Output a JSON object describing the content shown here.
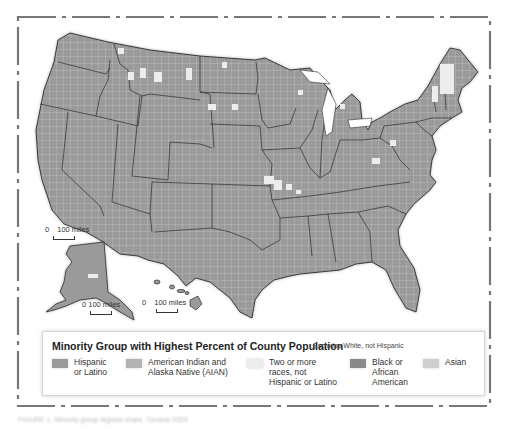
{
  "map": {
    "title": "Minority Group with Highest Percent of County Population",
    "subtitle": "Excludes White, not Hispanic",
    "colors": {
      "hispanic": "#9a9a9a",
      "aian": "#b3b3b3",
      "two_or_more": "#ededed",
      "black": "#8a8a8a",
      "asian": "#cfcfcf",
      "state_border": "#2b2b2b",
      "county_border": "#e2e2e2",
      "frame": "#777777"
    },
    "legend": [
      {
        "key": "hispanic",
        "label": "Hispanic\nor Latino",
        "color": "#9a9a9a"
      },
      {
        "key": "aian",
        "label": "American Indian and\nAlaska Native (AIAN)",
        "color": "#b3b3b3"
      },
      {
        "key": "two_or_more",
        "label": "Two or more\nraces, not\nHispanic or Latino",
        "color": "#ededed"
      },
      {
        "key": "black",
        "label": "Black or\nAfrican\nAmerican",
        "color": "#8a8a8a"
      },
      {
        "key": "asian",
        "label": "Asian",
        "color": "#cfcfcf"
      }
    ],
    "scales": [
      {
        "region": "contiguous-us",
        "label_zero": "0",
        "label_dist": "100 miles"
      },
      {
        "region": "alaska",
        "label_zero": "0",
        "label_dist": "100 miles"
      },
      {
        "region": "hawaii",
        "label_zero": "0",
        "label_dist": "100 miles"
      }
    ]
  },
  "footer": {
    "caption": "FIGURE 1. Minority group highest share, Census 2020"
  }
}
